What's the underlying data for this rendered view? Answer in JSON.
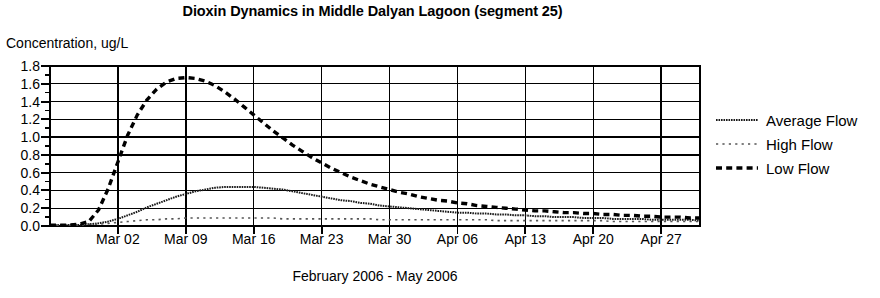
{
  "chart_data": {
    "type": "line",
    "title": "Dioxin Dynamics in Middle Dalyan Lagoon (segment 25)",
    "ylabel": "Concentration, ug/L",
    "xlabel": "February 2006 - May 2006",
    "grid": true,
    "legend_position": "right",
    "ylim": [
      0.0,
      1.8
    ],
    "yticks": [
      "0.0",
      "0.2",
      "0.4",
      "0.6",
      "0.8",
      "1.0",
      "1.2",
      "1.4",
      "1.6",
      "1.8"
    ],
    "ytick_values": [
      0.0,
      0.2,
      0.4,
      0.6,
      0.8,
      1.0,
      1.2,
      1.4,
      1.6,
      1.8
    ],
    "minor_ticks": true,
    "xticks": [
      "Mar 02",
      "Mar 09",
      "Mar 16",
      "Mar 23",
      "Mar 30",
      "Apr 06",
      "Apr 13",
      "Apr 20",
      "Apr 27"
    ],
    "xtick_day_index": [
      7,
      14,
      21,
      28,
      35,
      42,
      49,
      56,
      63
    ],
    "xlim_day_index": [
      0,
      67
    ],
    "x_days": [
      0,
      1,
      2,
      3,
      4,
      5,
      6,
      7,
      8,
      9,
      10,
      11,
      12,
      13,
      14,
      15,
      16,
      17,
      18,
      19,
      20,
      21,
      22,
      23,
      24,
      25,
      26,
      27,
      28,
      29,
      30,
      31,
      32,
      33,
      34,
      35,
      36,
      37,
      38,
      39,
      40,
      41,
      42,
      43,
      44,
      45,
      46,
      47,
      48,
      49,
      50,
      51,
      52,
      53,
      54,
      55,
      56,
      57,
      58,
      59,
      60,
      61,
      62,
      63,
      64,
      65,
      66,
      67
    ],
    "series": [
      {
        "name": "Average Flow",
        "style": "solid-fine",
        "color": "#1a1a1a",
        "values": [
          0.01,
          0.01,
          0.01,
          0.01,
          0.02,
          0.03,
          0.05,
          0.08,
          0.12,
          0.16,
          0.21,
          0.25,
          0.29,
          0.33,
          0.36,
          0.39,
          0.41,
          0.43,
          0.44,
          0.44,
          0.44,
          0.44,
          0.43,
          0.42,
          0.41,
          0.39,
          0.37,
          0.35,
          0.33,
          0.31,
          0.29,
          0.28,
          0.26,
          0.25,
          0.23,
          0.22,
          0.21,
          0.2,
          0.19,
          0.18,
          0.17,
          0.16,
          0.15,
          0.15,
          0.14,
          0.14,
          0.13,
          0.13,
          0.12,
          0.12,
          0.11,
          0.11,
          0.1,
          0.1,
          0.1,
          0.09,
          0.09,
          0.09,
          0.08,
          0.08,
          0.08,
          0.08,
          0.07,
          0.07,
          0.07,
          0.07,
          0.07,
          0.06
        ]
      },
      {
        "name": "High Flow",
        "style": "dotted-light",
        "color": "#555555",
        "values": [
          0.01,
          0.01,
          0.01,
          0.01,
          0.02,
          0.02,
          0.03,
          0.04,
          0.05,
          0.06,
          0.07,
          0.07,
          0.08,
          0.08,
          0.09,
          0.09,
          0.09,
          0.09,
          0.09,
          0.09,
          0.09,
          0.09,
          0.09,
          0.09,
          0.08,
          0.08,
          0.08,
          0.08,
          0.08,
          0.08,
          0.08,
          0.08,
          0.08,
          0.08,
          0.07,
          0.07,
          0.07,
          0.07,
          0.07,
          0.07,
          0.07,
          0.07,
          0.07,
          0.07,
          0.07,
          0.07,
          0.06,
          0.06,
          0.06,
          0.06,
          0.06,
          0.06,
          0.06,
          0.06,
          0.06,
          0.06,
          0.06,
          0.06,
          0.05,
          0.05,
          0.05,
          0.05,
          0.05,
          0.05,
          0.05,
          0.05,
          0.05,
          0.05
        ]
      },
      {
        "name": "Low Flow",
        "style": "dashed-bold",
        "color": "#000000",
        "values": [
          0.01,
          0.01,
          0.01,
          0.02,
          0.05,
          0.18,
          0.42,
          0.72,
          1.02,
          1.25,
          1.42,
          1.54,
          1.62,
          1.66,
          1.67,
          1.66,
          1.63,
          1.58,
          1.51,
          1.43,
          1.34,
          1.25,
          1.16,
          1.07,
          0.99,
          0.91,
          0.84,
          0.77,
          0.71,
          0.65,
          0.6,
          0.55,
          0.51,
          0.47,
          0.44,
          0.41,
          0.38,
          0.36,
          0.33,
          0.31,
          0.29,
          0.28,
          0.26,
          0.25,
          0.23,
          0.22,
          0.21,
          0.2,
          0.19,
          0.18,
          0.17,
          0.17,
          0.16,
          0.15,
          0.15,
          0.14,
          0.14,
          0.13,
          0.13,
          0.12,
          0.12,
          0.11,
          0.11,
          0.1,
          0.1,
          0.1,
          0.09,
          0.09
        ]
      }
    ]
  }
}
